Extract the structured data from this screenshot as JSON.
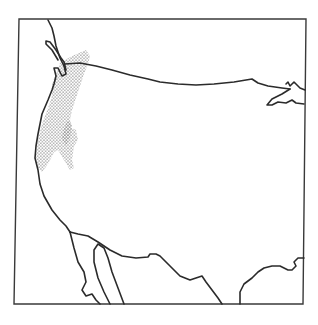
{
  "map": {
    "subject": "Western and central United States outline map",
    "region_shaded": "Pacific Northwest coastal strip and Cascade range",
    "shading_style": "stipple",
    "colors": {
      "ink": "#2b2b2b",
      "stipple": "#9a9a9a",
      "background": "#ffffff"
    },
    "features": [
      "map-frame",
      "canada-us-border",
      "pacific-coastline",
      "puget-sound",
      "us-mexico-border",
      "baja-california",
      "gulf-of-california",
      "gulf-coast-texas",
      "lake-superior",
      "stippled-range-area"
    ]
  }
}
